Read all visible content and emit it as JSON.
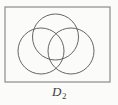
{
  "figure": {
    "caption_base": "D",
    "caption_subscript": "2",
    "caption_full": "D₂",
    "background_color": "#fbfbfa",
    "frame": {
      "name": "universal-set-rectangle",
      "x": 5,
      "y": 7,
      "width": 105,
      "height": 75,
      "stroke_color": "#8b8b8b",
      "stroke_width": 1.2,
      "fill": "none"
    },
    "circles": [
      {
        "name": "venn-circle-top",
        "position": "top",
        "cx": 55.5,
        "cy": 37,
        "r": 23,
        "stroke_color": "#555555",
        "stroke_width": 0.9,
        "fill": "none"
      },
      {
        "name": "venn-circle-left",
        "position": "bottom-left",
        "cx": 41,
        "cy": 51,
        "r": 23,
        "stroke_color": "#555555",
        "stroke_width": 0.9,
        "fill": "none"
      },
      {
        "name": "venn-circle-right",
        "position": "bottom-right",
        "cx": 71,
        "cy": 51,
        "r": 23,
        "stroke_color": "#555555",
        "stroke_width": 0.9,
        "fill": "none"
      }
    ]
  }
}
